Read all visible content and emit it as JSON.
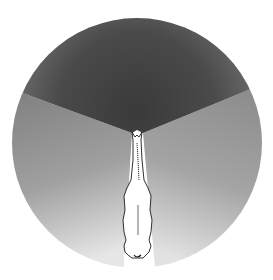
{
  "diagram": {
    "regions": [
      {
        "name": "binocular-field",
        "color": "#4a4a4a"
      },
      {
        "name": "left-monocular-field",
        "color": "#8c8c8c"
      },
      {
        "name": "right-monocular-field",
        "color": "#8c8c8c"
      },
      {
        "name": "blind-spot",
        "color": "#ffffff"
      }
    ],
    "colors": {
      "background": "#ffffff",
      "binocular_dark": "#3e3e3e",
      "binocular_light": "#6a6a6a",
      "monocular_dark": "#7a7a7a",
      "monocular_light": "#d8d8d8",
      "horse_fill": "#ffffff",
      "horse_outline": "#1a1a1a"
    }
  }
}
